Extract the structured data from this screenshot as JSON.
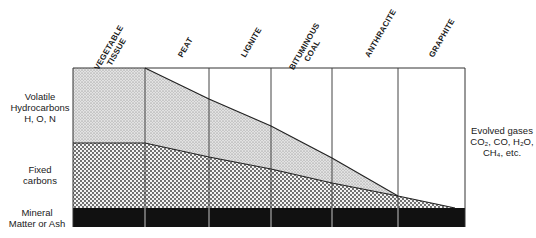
{
  "diagram": {
    "columns": [
      {
        "label_line1": "VEGETABLE",
        "label_line2": "TISSUE"
      },
      {
        "label_line1": "PEAT",
        "label_line2": ""
      },
      {
        "label_line1": "LIGNITE",
        "label_line2": ""
      },
      {
        "label_line1": "BITUMINOUS",
        "label_line2": "COAL"
      },
      {
        "label_line1": "ANTHRACITE",
        "label_line2": ""
      },
      {
        "label_line1": "GRAPHITE",
        "label_line2": ""
      }
    ],
    "left_labels": {
      "volatile": [
        "Volatile",
        "Hydrocarbons",
        "H, O, N"
      ],
      "fixed": [
        "Fixed",
        "carbons"
      ],
      "ash": [
        "Mineral",
        "Matter or Ash"
      ]
    },
    "right_label": {
      "line1": "Evolved gases",
      "line2": "CO₂, CO, H₂O,",
      "line3": "CH₄, etc."
    },
    "layers": [
      {
        "name": "Volatile hydrocarbons",
        "pattern": "fine-stipple"
      },
      {
        "name": "Fixed carbons",
        "pattern": "coarse-dots"
      },
      {
        "name": "Mineral matter or ash",
        "pattern": "solid-black"
      }
    ]
  }
}
